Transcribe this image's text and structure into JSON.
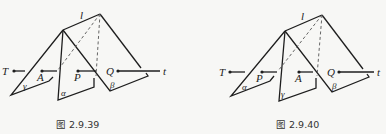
{
  "figures": [
    {
      "caption": "图 2.9.39",
      "line_label": "l",
      "left_point": "T",
      "right_point": "Q",
      "ray_label": "t",
      "plane_left": "γ",
      "plane_middle": "α",
      "plane_right": "β",
      "point_in_left_gap": "A",
      "point_in_right_gap": "P"
    },
    {
      "caption": "图 2.9.40",
      "line_label": "l",
      "left_point": "T",
      "right_point": "Q",
      "ray_label": "t",
      "plane_left": "α",
      "plane_middle": "γ",
      "plane_right": "β",
      "point_in_left_gap": "P",
      "point_in_right_gap": "A"
    }
  ]
}
